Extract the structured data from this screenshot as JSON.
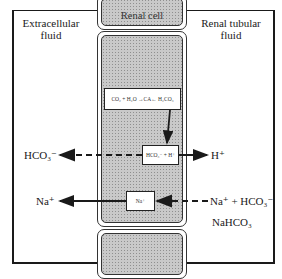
{
  "regions": {
    "left_label": [
      "Extracellular",
      "fluid"
    ],
    "center_label": "Renal cell",
    "right_label": [
      "Renal tubular",
      "fluid"
    ]
  },
  "reaction_box": {
    "equation": "CO₂ + H₂O ⇌ H₂CO₃",
    "enzyme": "CA",
    "text": "CO₂ + H₂O →CA← H₂CO₃"
  },
  "dissociation_box": {
    "text": "HCO₃⁻ + H⁺"
  },
  "sodium_box": {
    "text": "Na⁺"
  },
  "ions": {
    "bicarbonate_out": "HCO₃⁻",
    "proton_secreted": "H⁺",
    "sodium_out": "Na⁺",
    "tubular_in": "Na⁺ + HCO₃⁻",
    "tubular_salt": "NaHCO₃"
  },
  "arrows": [
    {
      "from": "reaction_box",
      "to": "dissociation_box",
      "style": "solid"
    },
    {
      "from": "dissociation_box",
      "to": "extracellular_fluid",
      "label": "HCO₃⁻",
      "style": "dashed"
    },
    {
      "from": "dissociation_box",
      "to": "renal_tubular_fluid",
      "label": "H⁺",
      "style": "solid"
    },
    {
      "from": "renal_tubular_fluid",
      "to": "sodium_box",
      "label": "Na⁺ + HCO₃⁻",
      "style": "dashed"
    },
    {
      "from": "sodium_box",
      "to": "extracellular_fluid",
      "label": "Na⁺",
      "style": "solid"
    }
  ],
  "colors": {
    "stroke": "#1a1a1a",
    "cell_fill": "#c9c9c9",
    "background": "#ffffff"
  }
}
